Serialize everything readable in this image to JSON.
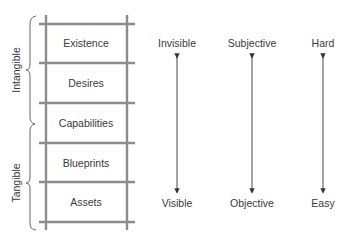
{
  "groups": [
    {
      "label": "Intangible",
      "y_top": 16,
      "y_bottom": 124
    },
    {
      "label": "Tangible",
      "y_top": 124,
      "y_bottom": 230
    }
  ],
  "ladder": {
    "levels": [
      "Existence",
      "Desires",
      "Capabilities",
      "Blueprints",
      "Assets"
    ],
    "rail_color": "#8c8c8c"
  },
  "scales": [
    {
      "top": "Invisible",
      "bottom": "Visible"
    },
    {
      "top": "Subjective",
      "bottom": "Objective"
    },
    {
      "top": "Hard",
      "bottom": "Easy"
    }
  ],
  "colors": {
    "arrow": "#333333",
    "brace": "#555555",
    "text": "#3a3a3a"
  }
}
